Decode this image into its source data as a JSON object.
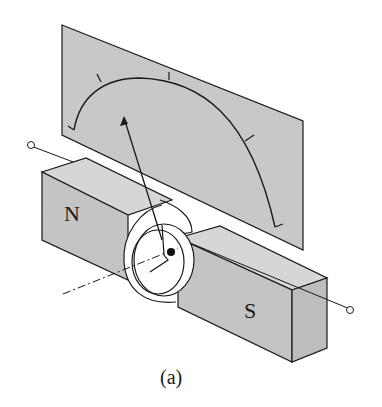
{
  "figure": {
    "caption": "(a)"
  },
  "labels": {
    "north_pole": "N",
    "south_pole": "S"
  },
  "colors": {
    "background": "#ffffff",
    "panel_fill": "#c8c8c8",
    "magnet_top": "#d6d6d6",
    "magnet_front": "#c4c4c4",
    "magnet_side": "#bdbdbd",
    "stroke": "#1a1a1a"
  },
  "components": [
    {
      "id": "scale-panel",
      "label": "Scale panel"
    },
    {
      "id": "scale-arc",
      "label": "Scale arc with tick marks"
    },
    {
      "id": "pointer",
      "label": "Pointer needle"
    },
    {
      "id": "north-magnet",
      "label": "N pole magnet"
    },
    {
      "id": "south-magnet",
      "label": "S pole magnet"
    },
    {
      "id": "coil",
      "label": "Rotating coil"
    },
    {
      "id": "pivot",
      "label": "Pivot"
    },
    {
      "id": "axis",
      "label": "Rotation axis (dash-dot)"
    },
    {
      "id": "lead-wire",
      "label": "Lead wire with terminals"
    }
  ]
}
